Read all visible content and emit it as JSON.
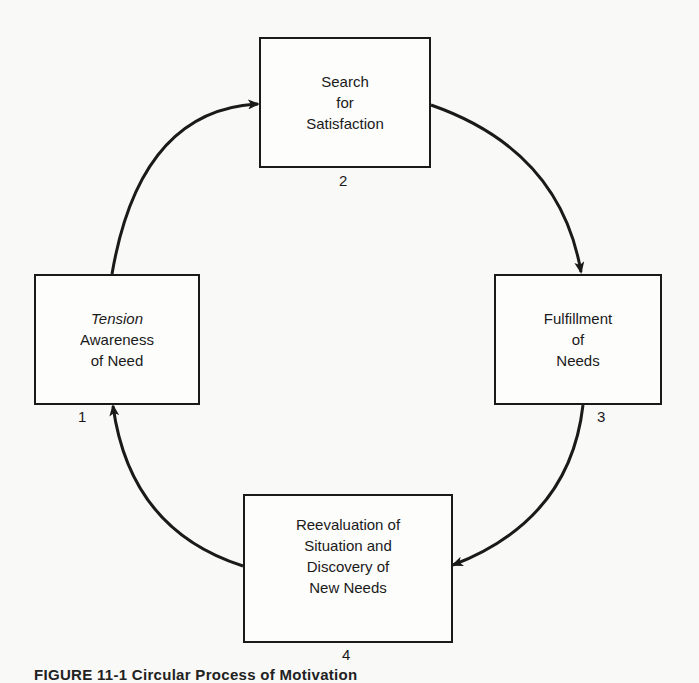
{
  "diagram": {
    "type": "cycle",
    "nodes": [
      {
        "id": 1,
        "number": "1",
        "lines": [
          "Tension",
          "Awareness",
          "of Need"
        ],
        "italic_first_line": true
      },
      {
        "id": 2,
        "number": "2",
        "lines": [
          "Search",
          "for",
          "Satisfaction"
        ]
      },
      {
        "id": 3,
        "number": "3",
        "lines": [
          "Fulfillment",
          "of",
          "Needs"
        ]
      },
      {
        "id": 4,
        "number": "4",
        "lines": [
          "Reevaluation of",
          "Situation and",
          "Discovery of",
          "New Needs"
        ]
      }
    ],
    "edges": [
      {
        "from": 1,
        "to": 2
      },
      {
        "from": 2,
        "to": 3
      },
      {
        "from": 3,
        "to": 4
      },
      {
        "from": 4,
        "to": 1
      }
    ],
    "caption": "FIGURE 11-1  Circular Process of Motivation"
  }
}
